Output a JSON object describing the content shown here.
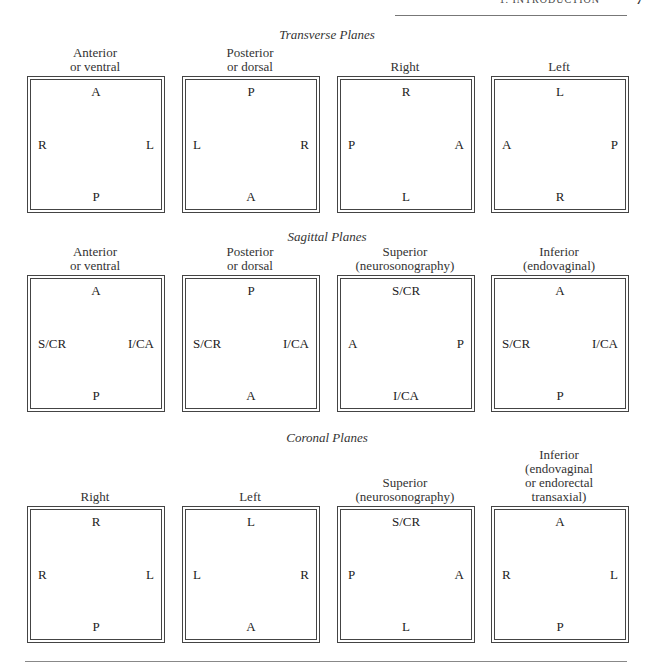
{
  "header": {
    "running_title": "1. INTRODUCTION",
    "page_number": "7"
  },
  "sections": [
    {
      "title": "Transverse Planes",
      "panels": [
        {
          "caption": [
            "Anterior",
            "or ventral"
          ],
          "top": "A",
          "bottom": "P",
          "left": "R",
          "right": "L"
        },
        {
          "caption": [
            "Posterior",
            "or dorsal"
          ],
          "top": "P",
          "bottom": "A",
          "left": "L",
          "right": "R"
        },
        {
          "caption": [
            "Right"
          ],
          "top": "R",
          "bottom": "L",
          "left": "P",
          "right": "A"
        },
        {
          "caption": [
            "Left"
          ],
          "top": "L",
          "bottom": "R",
          "left": "A",
          "right": "P"
        }
      ]
    },
    {
      "title": "Sagittal Planes",
      "panels": [
        {
          "caption": [
            "Anterior",
            "or ventral"
          ],
          "top": "A",
          "bottom": "P",
          "left": "S/CR",
          "right": "I/CA"
        },
        {
          "caption": [
            "Posterior",
            "or dorsal"
          ],
          "top": "P",
          "bottom": "A",
          "left": "S/CR",
          "right": "I/CA"
        },
        {
          "caption": [
            "Superior",
            "(neurosonography)"
          ],
          "top": "S/CR",
          "bottom": "I/CA",
          "left": "A",
          "right": "P"
        },
        {
          "caption": [
            "Inferior",
            "(endovaginal)"
          ],
          "top": "A",
          "bottom": "P",
          "left": "S/CR",
          "right": "I/CA"
        }
      ]
    },
    {
      "title": "Coronal Planes",
      "panels": [
        {
          "caption": [
            "Right"
          ],
          "top": "R",
          "bottom": "P",
          "left": "R",
          "right": "L"
        },
        {
          "caption": [
            "Left"
          ],
          "top": "L",
          "bottom": "A",
          "left": "L",
          "right": "R"
        },
        {
          "caption": [
            "Superior",
            "(neurosonography)"
          ],
          "top": "S/CR",
          "bottom": "L",
          "left": "P",
          "right": "A"
        },
        {
          "caption": [
            "Inferior",
            "(endovaginal",
            "or endorectal",
            "transaxial)"
          ],
          "top": "A",
          "bottom": "P",
          "left": "R",
          "right": "L"
        }
      ]
    }
  ]
}
